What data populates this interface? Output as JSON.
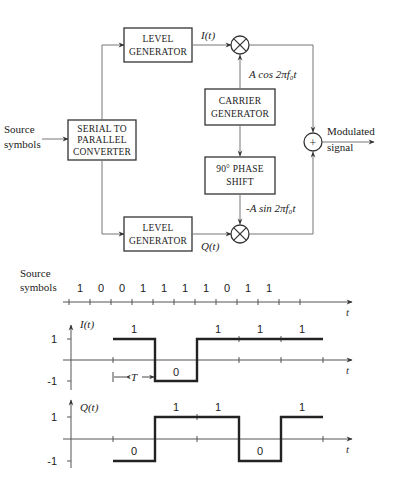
{
  "diagram": {
    "input_label": [
      "Source",
      "symbols"
    ],
    "output_label": [
      "Modulated",
      "signal"
    ],
    "blocks": {
      "serial_to_parallel": [
        "SERIAL TO",
        "PARALLEL",
        "CONVERTER"
      ],
      "level_generator_top": [
        "LEVEL",
        "GENERATOR"
      ],
      "level_generator_bottom": [
        "LEVEL",
        "GENERATOR"
      ],
      "carrier_generator": [
        "CARRIER",
        "GENERATOR"
      ],
      "phase_shift": [
        "90° PHASE",
        "SHIFT"
      ]
    },
    "signals": {
      "i": "I(t)",
      "q": "Q(t)",
      "cos_carrier": "A cos 2πf₀t",
      "sin_carrier": "-A sin 2πf₀t"
    },
    "operators": {
      "multiplier_symbol": "⊗",
      "adder_symbol": "+"
    }
  },
  "waveforms": {
    "source": {
      "label": [
        "Source",
        "symbols"
      ],
      "bits": [
        "1",
        "0",
        "0",
        "1",
        "1",
        "1",
        "1",
        "0",
        "1",
        "1"
      ],
      "axis_label": "t"
    },
    "i_plot": {
      "ylabel": "I(t)",
      "ytick_pos": "1",
      "ytick_neg": "-1",
      "axis_label": "t",
      "period_label": "T",
      "segments": [
        {
          "bit": "1",
          "level": 1
        },
        {
          "bit": "0",
          "level": -1
        },
        {
          "bit": "1",
          "level": 1
        },
        {
          "bit": "1",
          "level": 1
        },
        {
          "bit": "1",
          "level": 1
        }
      ]
    },
    "q_plot": {
      "ylabel": "Q(t)",
      "ytick_pos": "1",
      "ytick_neg": "-1",
      "axis_label": "t",
      "segments": [
        {
          "bit": "0",
          "level": -1
        },
        {
          "bit": "1",
          "level": 1
        },
        {
          "bit": "1",
          "level": 1
        },
        {
          "bit": "0",
          "level": -1
        },
        {
          "bit": "1",
          "level": 1
        }
      ]
    }
  }
}
